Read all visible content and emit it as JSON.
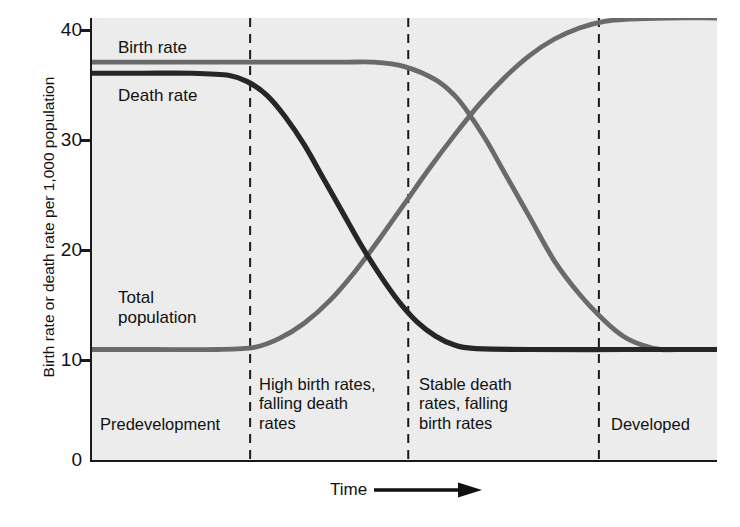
{
  "chart_data": {
    "type": "line",
    "title": "",
    "xlabel": "Time",
    "ylabel": "Birth rate or death rate per 1,000 population",
    "ylim": [
      0,
      40
    ],
    "yticks": [
      0,
      10,
      20,
      30,
      40
    ],
    "xticks": [],
    "grid": false,
    "legend_position": "in-plot annotations",
    "x_axis_arrow": true,
    "background": "#ececec",
    "series": [
      {
        "name": "Birth rate",
        "color": "#6a6a6a",
        "label_x_pct": 6,
        "label_y_pct": 6,
        "description": "High and flat at 36 through predevelopment and stage two, then falls steeply through stage three to 10, stable thereafter",
        "points": [
          {
            "x": 0,
            "y": 36
          },
          {
            "x": 10,
            "y": 36
          },
          {
            "x": 20,
            "y": 36
          },
          {
            "x": 30,
            "y": 36
          },
          {
            "x": 40,
            "y": 36
          },
          {
            "x": 45,
            "y": 36
          },
          {
            "x": 50,
            "y": 35.6
          },
          {
            "x": 55,
            "y": 34.4
          },
          {
            "x": 58,
            "y": 33
          },
          {
            "x": 60,
            "y": 31.6
          },
          {
            "x": 63,
            "y": 29
          },
          {
            "x": 66,
            "y": 26
          },
          {
            "x": 70,
            "y": 22
          },
          {
            "x": 74,
            "y": 18
          },
          {
            "x": 78,
            "y": 15
          },
          {
            "x": 82,
            "y": 12.6
          },
          {
            "x": 85,
            "y": 11.2
          },
          {
            "x": 88,
            "y": 10.4
          },
          {
            "x": 91,
            "y": 10
          },
          {
            "x": 95,
            "y": 10
          },
          {
            "x": 100,
            "y": 10
          }
        ]
      },
      {
        "name": "Death rate",
        "color": "#262626",
        "label_x_pct": 6,
        "label_y_pct": 17,
        "description": "High and flat at 35 through predevelopment, falls steeply through stage two to 10, stable thereafter",
        "points": [
          {
            "x": 0,
            "y": 35
          },
          {
            "x": 8,
            "y": 35
          },
          {
            "x": 16,
            "y": 35
          },
          {
            "x": 22,
            "y": 34.8
          },
          {
            "x": 25,
            "y": 34.2
          },
          {
            "x": 28,
            "y": 33
          },
          {
            "x": 31,
            "y": 31
          },
          {
            "x": 34,
            "y": 28.5
          },
          {
            "x": 37,
            "y": 25.5
          },
          {
            "x": 40,
            "y": 22.5
          },
          {
            "x": 43,
            "y": 19.5
          },
          {
            "x": 46,
            "y": 16.8
          },
          {
            "x": 49,
            "y": 14.4
          },
          {
            "x": 52,
            "y": 12.5
          },
          {
            "x": 55,
            "y": 11.2
          },
          {
            "x": 58,
            "y": 10.4
          },
          {
            "x": 61,
            "y": 10.1
          },
          {
            "x": 70,
            "y": 10
          },
          {
            "x": 85,
            "y": 10
          },
          {
            "x": 100,
            "y": 10
          }
        ]
      },
      {
        "name": "Total population",
        "color": "#6a6a6a",
        "label_x_pct": 6,
        "label_y_pct": 64,
        "description": "Low and flat at 10 through predevelopment, rises steeply through stages two and three, plateaus at 40 in the developed stage",
        "points": [
          {
            "x": 0,
            "y": 10
          },
          {
            "x": 10,
            "y": 10
          },
          {
            "x": 20,
            "y": 10
          },
          {
            "x": 26,
            "y": 10.2
          },
          {
            "x": 30,
            "y": 11
          },
          {
            "x": 34,
            "y": 12.4
          },
          {
            "x": 38,
            "y": 14.4
          },
          {
            "x": 42,
            "y": 17
          },
          {
            "x": 46,
            "y": 20
          },
          {
            "x": 50,
            "y": 23.2
          },
          {
            "x": 54,
            "y": 26.4
          },
          {
            "x": 58,
            "y": 29.4
          },
          {
            "x": 62,
            "y": 32.2
          },
          {
            "x": 66,
            "y": 34.6
          },
          {
            "x": 70,
            "y": 36.6
          },
          {
            "x": 74,
            "y": 38.1
          },
          {
            "x": 78,
            "y": 39.1
          },
          {
            "x": 82,
            "y": 39.7
          },
          {
            "x": 86,
            "y": 39.9
          },
          {
            "x": 92,
            "y": 40
          },
          {
            "x": 100,
            "y": 40
          }
        ]
      }
    ],
    "crossovers": [
      {
        "between": [
          "Death rate",
          "Total population"
        ],
        "x": 41,
        "y": 16.5
      },
      {
        "between": [
          "Birth rate",
          "Total population"
        ],
        "x": 60,
        "y": 31
      }
    ],
    "dividers": [
      {
        "x": 25.3
      },
      {
        "x": 50.6
      },
      {
        "x": 81.1
      }
    ],
    "stages": [
      {
        "id": "predevelopment",
        "label": "Predevelopment",
        "x_start": 0,
        "x_end": 25.3,
        "label_x_pct": 2,
        "label_y_pct": 88
      },
      {
        "id": "stage-two",
        "label": "High birth rates, falling death rates",
        "x_start": 25.3,
        "x_end": 50.6,
        "label_x_pct": 27,
        "label_y_pct": 76
      },
      {
        "id": "stage-three",
        "label": "Stable death rates, falling birth rates",
        "x_start": 50.6,
        "x_end": 81.1,
        "label_x_pct": 52.5,
        "label_y_pct": 76
      },
      {
        "id": "developed",
        "label": "Developed",
        "x_start": 81.1,
        "x_end": 100,
        "label_x_pct": 83,
        "label_y_pct": 88
      }
    ]
  },
  "axis": {
    "y_title": "Birth rate or death rate per 1,000 population",
    "x_title": "Time",
    "y_ticks": [
      "40",
      "30",
      "20",
      "10",
      "0"
    ]
  },
  "series_labels": {
    "birth_rate": "Birth rate",
    "death_rate": "Death rate",
    "total_population_line1": "Total",
    "total_population_line2": "population"
  },
  "stage_labels": {
    "predevelopment": "Predevelopment",
    "stage_two_line1": "High birth rates,",
    "stage_two_line2": "falling death",
    "stage_two_line3": "rates",
    "stage_three_line1": "Stable death",
    "stage_three_line2": "rates, falling",
    "stage_three_line3": "birth rates",
    "developed": "Developed"
  },
  "colors": {
    "birth_rate": "#6a6a6a",
    "death_rate": "#262626",
    "total_population": "#6a6a6a",
    "plot_background": "#ececec",
    "axis": "#1a1a1a"
  }
}
